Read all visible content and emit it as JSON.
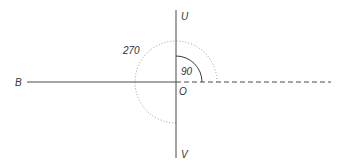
{
  "diagram": {
    "type": "angle-diagram",
    "colors": {
      "line": "#4a4a4a",
      "arc_solid": "#3a3a3a",
      "arc_dotted": "#9a9a9a",
      "text": "#333333"
    },
    "points": {
      "top": "U",
      "bottom": "V",
      "left": "B",
      "origin": "O"
    },
    "angles": {
      "small": "90",
      "large": "270"
    }
  }
}
